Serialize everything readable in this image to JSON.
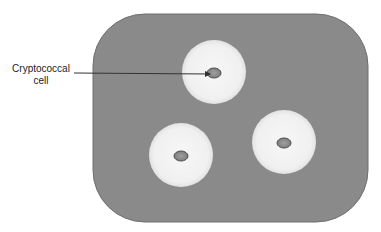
{
  "figure": {
    "label": {
      "line1": "Cryptococcal",
      "line2": "cell"
    },
    "colors": {
      "background_field": "#8a8a8a",
      "field_border": "#6f6f6f",
      "capsule": "#f2f2f2",
      "capsule_edge": "#e0e0e0",
      "cell_fill": "#8f8f8f",
      "cell_border": "#4d4d4d",
      "leader_line": "#333333"
    },
    "field": {
      "x": 93,
      "y": 14,
      "width": 275,
      "height": 208,
      "corner_radius": 52
    },
    "capsules": [
      {
        "cx": 214,
        "cy": 72,
        "r": 32,
        "cell_rx": 7,
        "cell_ry": 5
      },
      {
        "cx": 181,
        "cy": 155,
        "r": 32,
        "cell_rx": 7,
        "cell_ry": 5
      },
      {
        "cx": 284,
        "cy": 142,
        "r": 32,
        "cell_rx": 7,
        "cell_ry": 5
      }
    ],
    "leader": {
      "x1": 74,
      "y1": 73,
      "x2": 211,
      "y2": 74
    }
  }
}
